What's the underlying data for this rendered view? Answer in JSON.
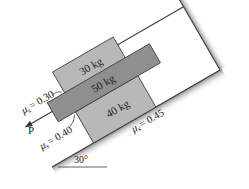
{
  "figure": {
    "type": "statics-diagram",
    "incline_angle_label": "30°",
    "force_label": "P",
    "blocks": [
      {
        "label": "30 kg",
        "position": "top"
      },
      {
        "label": "50 kg",
        "position": "middle"
      },
      {
        "label": "40 kg",
        "position": "bottom"
      }
    ],
    "friction": [
      {
        "label": "μs = 0.30",
        "mu_symbol": "μ",
        "sub": "s",
        "value": "= 0.30",
        "between": "30 kg / 50 kg"
      },
      {
        "label": "μs = 0.40",
        "mu_symbol": "μ",
        "sub": "s",
        "value": "= 0.40",
        "between": "50 kg / 40 kg"
      },
      {
        "label": "μs = 0.45",
        "mu_symbol": "μ",
        "sub": "s",
        "value": "= 0.45",
        "between": "40 kg / incline"
      }
    ],
    "colors": {
      "block_light": "#b8b8b8",
      "block_dark": "#8f8f8f",
      "outline": "#3a3a3a",
      "shadow": "#9a9a9a"
    }
  }
}
